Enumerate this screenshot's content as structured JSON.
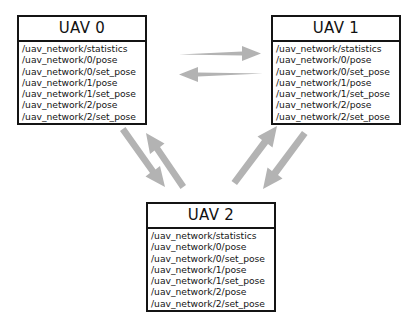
{
  "diagram": {
    "background_color": "#ffffff",
    "box_border_color": "#141414",
    "arrow_color": "#b3b3b3",
    "nodes": [
      {
        "id": "uav0",
        "title": "UAV 0",
        "topics": [
          "/uav_network/statistics",
          "/uav_network/0/pose",
          "/uav_network/0/set_pose",
          "/uav_network/1/pose",
          "/uav_network/1/set_pose",
          "/uav_network/2/pose",
          "/uav_network/2/set_pose"
        ]
      },
      {
        "id": "uav1",
        "title": "UAV 1",
        "topics": [
          "/uav_network/statistics",
          "/uav_network/0/pose",
          "/uav_network/0/set_pose",
          "/uav_network/1/pose",
          "/uav_network/1/set_pose",
          "/uav_network/2/pose",
          "/uav_network/2/set_pose"
        ]
      },
      {
        "id": "uav2",
        "title": "UAV 2",
        "topics": [
          "/uav_network/statistics",
          "/uav_network/0/pose",
          "/uav_network/0/set_pose",
          "/uav_network/1/pose",
          "/uav_network/1/set_pose",
          "/uav_network/2/pose",
          "/uav_network/2/set_pose"
        ]
      }
    ],
    "edges": [
      {
        "id": "edge-uav0-to-uav1",
        "from": "uav0",
        "to": "uav1",
        "direction": "right"
      },
      {
        "id": "edge-uav1-to-uav0",
        "from": "uav1",
        "to": "uav0",
        "direction": "left"
      },
      {
        "id": "edge-uav0-to-uav2",
        "from": "uav0",
        "to": "uav2",
        "direction": "down-right"
      },
      {
        "id": "edge-uav2-to-uav0",
        "from": "uav2",
        "to": "uav0",
        "direction": "up-left"
      },
      {
        "id": "edge-uav1-to-uav2",
        "from": "uav1",
        "to": "uav2",
        "direction": "down-left"
      },
      {
        "id": "edge-uav2-to-uav1",
        "from": "uav2",
        "to": "uav1",
        "direction": "up-right"
      }
    ]
  }
}
